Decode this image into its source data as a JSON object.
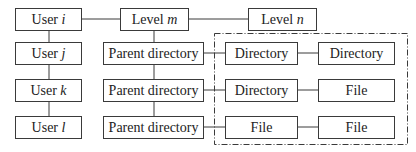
{
  "users": [
    {
      "prefix": "User ",
      "var": "i"
    },
    {
      "prefix": "User ",
      "var": "j"
    },
    {
      "prefix": "User ",
      "var": "k"
    },
    {
      "prefix": "User ",
      "var": "l"
    }
  ],
  "levels": [
    {
      "prefix": "Level ",
      "var": "m"
    },
    {
      "prefix": "Level ",
      "var": "n"
    }
  ],
  "parents": [
    {
      "label": "Parent directory"
    },
    {
      "label": "Parent directory"
    },
    {
      "label": "Parent directory"
    }
  ],
  "children": [
    {
      "first": "Directory",
      "second": "Directory"
    },
    {
      "first": "Directory",
      "second": "File"
    },
    {
      "first": "File",
      "second": "File"
    }
  ],
  "colors": {
    "line": "#3a3a3a",
    "background": "#ffffff"
  }
}
